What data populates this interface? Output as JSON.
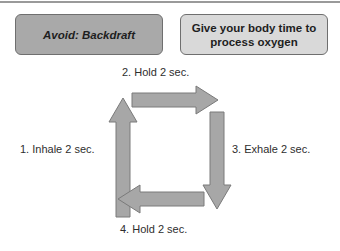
{
  "boxes": {
    "left": {
      "text": "Avoid: Backdraft",
      "fill": "#a9a9a9"
    },
    "right": {
      "line1": "Give your body time to",
      "line2": "process oxygen",
      "fill": "#d9d9d9"
    }
  },
  "steps": [
    {
      "label": "1.  Inhale 2 sec.",
      "direction": "up"
    },
    {
      "label": "2.  Hold 2 sec.",
      "direction": "right"
    },
    {
      "label": "3.  Exhale 2 sec.",
      "direction": "down"
    },
    {
      "label": "4.  Hold 2 sec.",
      "direction": "left"
    }
  ],
  "colors": {
    "arrow_fill": "#a7a7a7",
    "arrow_stroke": "#7a7a7a"
  }
}
